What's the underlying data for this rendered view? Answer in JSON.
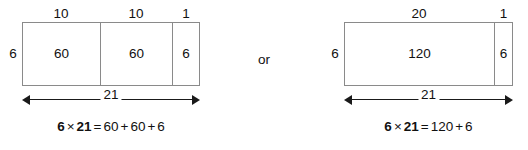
{
  "figure": {
    "connector": "or"
  },
  "models": [
    {
      "name": "three-part-area-model",
      "side_label": "6",
      "top_labels": [
        "10",
        "10",
        "1"
      ],
      "inner_labels": [
        "60",
        "60",
        "6"
      ],
      "width_label": "21",
      "equation": {
        "factor1": "6",
        "times": "×",
        "factor2": "21",
        "equals": "=",
        "terms": [
          "60",
          "60",
          "6"
        ],
        "plus": "+",
        "full_text": "6 × 21 = 60 + 60 + 6"
      }
    },
    {
      "name": "two-part-area-model",
      "side_label": "6",
      "top_labels": [
        "20",
        "1"
      ],
      "inner_labels": [
        "120",
        "6"
      ],
      "width_label": "21",
      "equation": {
        "factor1": "6",
        "times": "×",
        "factor2": "21",
        "equals": "=",
        "terms": [
          "120",
          "6"
        ],
        "plus": "+",
        "full_text": "6 × 21 = 120 + 6"
      }
    }
  ],
  "colors": {
    "rect_stroke": "#8a8a8a",
    "arrow": "#1a1a1a",
    "text": "#111111",
    "background": "#ffffff"
  }
}
